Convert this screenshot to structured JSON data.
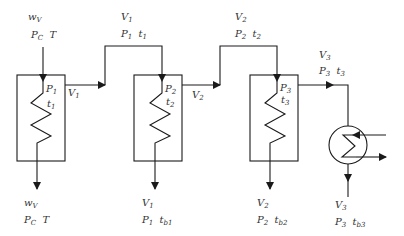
{
  "diagram": {
    "feed_in": {
      "line1": "w",
      "line1_sub": "V",
      "p": "P",
      "p_sub": "C",
      "t": "T"
    },
    "condensate_1": {
      "line1": "w",
      "line1_sub": "V",
      "p": "P",
      "p_sub": "C",
      "t": "T"
    },
    "effects": [
      {
        "id": 1,
        "inner_p": "P",
        "inner_p_sub": "1",
        "inner_t": "t",
        "inner_t_sub": "1",
        "side_v": "V",
        "side_v_sub": "1",
        "vapor_out": {
          "v": "V",
          "v_sub": "1",
          "p": "P",
          "p_sub": "1",
          "t": "t",
          "t_sub": "1"
        },
        "bottom": {
          "v": "V",
          "v_sub": "1",
          "p": "P",
          "p_sub": "1",
          "t": "t",
          "t_sub": "b1"
        }
      },
      {
        "id": 2,
        "inner_p": "P",
        "inner_p_sub": "2",
        "inner_t": "t",
        "inner_t_sub": "2",
        "side_v": "V",
        "side_v_sub": "2",
        "vapor_out": {
          "v": "V",
          "v_sub": "2",
          "p": "P",
          "p_sub": "2",
          "t": "t",
          "t_sub": "2"
        },
        "bottom": {
          "v": "V",
          "v_sub": "2",
          "p": "P",
          "p_sub": "2",
          "t": "t",
          "t_sub": "b2"
        }
      },
      {
        "id": 3,
        "inner_p": "P",
        "inner_p_sub": "3",
        "inner_t": "t",
        "inner_t_sub": "3",
        "vapor_out": {
          "v": "V",
          "v_sub": "3",
          "p": "P",
          "p_sub": "3",
          "t": "t",
          "t_sub": "3"
        },
        "bottom": {
          "v": "V",
          "v_sub": "3",
          "p": "P",
          "p_sub": "3",
          "t": "t",
          "t_sub": "b3"
        }
      }
    ],
    "colors": {
      "line": "#1a1a1a",
      "text": "#333333"
    }
  }
}
